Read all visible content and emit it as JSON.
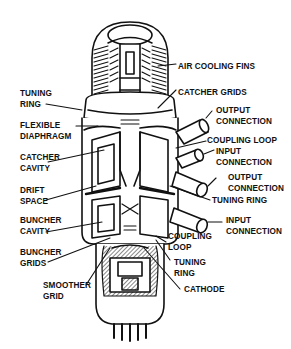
{
  "diagram": {
    "labels": {
      "air_cooling_fins": "AIR COOLING FINS",
      "tuning_ring_top": "TUNING\nRING",
      "catcher_grids": "CATCHER GRIDS",
      "output_connection_top": "OUTPUT\nCONNECTION",
      "flexible_diaphragm": "FLEXIBLE\nDIAPHRAGM",
      "coupling_loop_top": "COUPLING LOOP",
      "catcher_cavity": "CATCHER\nCAVITY",
      "input_connection_mid": "INPUT\nCONNECTION",
      "output_connection_mid": "OUTPUT\nCONNECTION",
      "drift_space": "DRIFT\nSPACE",
      "tuning_ring_mid": "TUNING RING",
      "buncher_cavity": "BUNCHER\nCAVITY",
      "input_connection_bottom": "INPUT\nCONNECTION",
      "buncher_grids": "BUNCHER\nGRIDS",
      "coupling_loop_bottom": "COUPLING\nLOOP",
      "tuning_ring_bottom": "TUNING\nRING",
      "smoother_grid": "SMOOTHER\nGRID",
      "cathode": "CATHODE"
    },
    "colors": {
      "ink": "#111111",
      "background": "#ffffff",
      "shade": "#9a9a9a"
    }
  }
}
